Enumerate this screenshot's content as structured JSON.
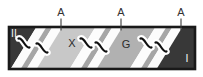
{
  "diagram": {
    "kind": "shear-zone band diagram",
    "top_markers": [
      {
        "label": "A"
      },
      {
        "label": "A"
      },
      {
        "label": "A"
      }
    ],
    "region_labels": {
      "left_end": "II",
      "zone_x": "X",
      "zone_g": "G",
      "right_end": "I"
    },
    "colors": {
      "background": "#ffffff",
      "border": "#191919",
      "end_blocks": "#383838",
      "zone_x_fill": "#c8c8c8",
      "zone_g_fill": "#b1b1b1",
      "inner_stripe": "#a6a6a6",
      "shear_band": "#fcfcfc",
      "gash_mark": "#101010",
      "gash_halo": "#ffffff",
      "label_dark": "#2b2b2b",
      "label_light": "#f4f4f4",
      "tick": "#3c3c3c"
    }
  }
}
